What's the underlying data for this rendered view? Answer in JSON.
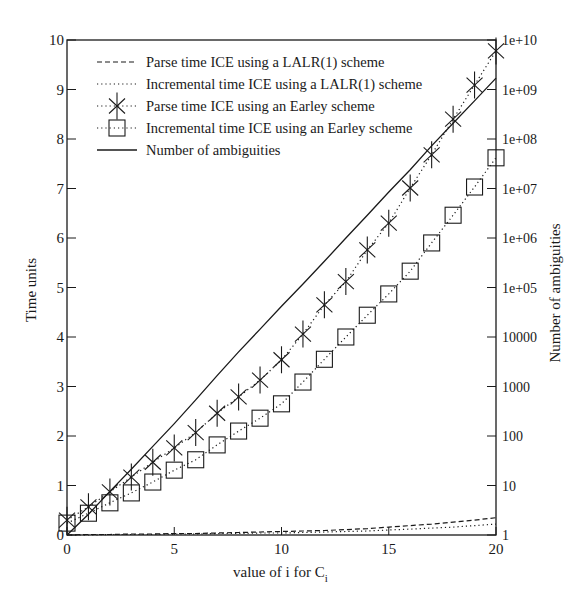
{
  "chart_data": {
    "type": "line",
    "title": "",
    "xlabel": "value of i for C",
    "xlabel_subscript": "i",
    "ylabel": "Time units",
    "y2label": "Number of ambiguities",
    "xlim": [
      0,
      20
    ],
    "ylim": [
      0,
      10
    ],
    "y2lim_log10": [
      0,
      10
    ],
    "y2scale": "log",
    "grid": false,
    "legend_position": "upper-left inside",
    "x_ticks": [
      0,
      5,
      10,
      15,
      20
    ],
    "x_tick_labels": [
      "0",
      "5",
      "10",
      "15",
      "20"
    ],
    "y_ticks": [
      0,
      1,
      2,
      3,
      4,
      5,
      6,
      7,
      8,
      9,
      10
    ],
    "y_tick_labels": [
      "0",
      "1",
      "2",
      "3",
      "4",
      "5",
      "6",
      "7",
      "8",
      "9",
      "10"
    ],
    "y2_ticks_log10": [
      0,
      1,
      2,
      3,
      4,
      5,
      6,
      7,
      8,
      9,
      10
    ],
    "y2_tick_labels": [
      "1",
      "10",
      "100",
      "1000",
      "10000",
      "1e+05",
      "1e+06",
      "1e+07",
      "1e+08",
      "1e+09",
      "1e+10"
    ],
    "x": [
      0,
      1,
      2,
      3,
      4,
      5,
      6,
      7,
      8,
      9,
      10,
      11,
      12,
      13,
      14,
      15,
      16,
      17,
      18,
      19,
      20
    ],
    "series": [
      {
        "name": "Parse time ICE using a LALR(1) scheme",
        "style": "dashed",
        "marker": "none",
        "axis": "left",
        "values": [
          0.0,
          0.01,
          0.01,
          0.02,
          0.02,
          0.03,
          0.03,
          0.04,
          0.05,
          0.06,
          0.07,
          0.08,
          0.09,
          0.11,
          0.13,
          0.16,
          0.19,
          0.22,
          0.26,
          0.3,
          0.35
        ]
      },
      {
        "name": "Incremental time ICE using a LALR(1) scheme",
        "style": "dotted",
        "marker": "none",
        "axis": "left",
        "values": [
          0.0,
          0.0,
          0.01,
          0.01,
          0.01,
          0.02,
          0.02,
          0.03,
          0.03,
          0.04,
          0.04,
          0.05,
          0.06,
          0.07,
          0.08,
          0.1,
          0.12,
          0.14,
          0.16,
          0.19,
          0.22
        ]
      },
      {
        "name": "Parse time ICE using an Earley scheme",
        "style": "dotted",
        "marker": "star",
        "axis": "left",
        "values": [
          0.3,
          0.57,
          0.87,
          1.17,
          1.47,
          1.76,
          2.07,
          2.46,
          2.79,
          3.13,
          3.54,
          4.06,
          4.65,
          5.12,
          5.76,
          6.3,
          7.01,
          7.68,
          8.4,
          9.09,
          9.78
        ]
      },
      {
        "name": "Incremental time ICE using an Earley scheme",
        "style": "dotted",
        "marker": "square",
        "axis": "left",
        "values": [
          0.24,
          0.44,
          0.65,
          0.85,
          1.07,
          1.31,
          1.52,
          1.82,
          2.1,
          2.36,
          2.65,
          3.09,
          3.55,
          4.0,
          4.44,
          4.87,
          5.33,
          5.9,
          6.46,
          7.03,
          7.62
        ]
      },
      {
        "name": "Number of ambiguities",
        "style": "solid",
        "marker": "none",
        "axis": "right",
        "values_log10": [
          0.0,
          0.42,
          0.88,
          1.33,
          1.79,
          2.25,
          2.73,
          3.22,
          3.7,
          4.16,
          4.62,
          5.07,
          5.53,
          6.0,
          6.46,
          6.93,
          7.38,
          7.86,
          8.32,
          8.77,
          9.23
        ]
      }
    ]
  },
  "legend": {
    "items": [
      "Parse time ICE using a LALR(1) scheme",
      "Incremental time ICE using a LALR(1) scheme",
      "Parse time ICE using an Earley scheme",
      "Incremental time ICE using an Earley scheme",
      "Number of ambiguities"
    ]
  },
  "colors": {
    "ink": "#1a1a1a",
    "background": "#ffffff"
  }
}
